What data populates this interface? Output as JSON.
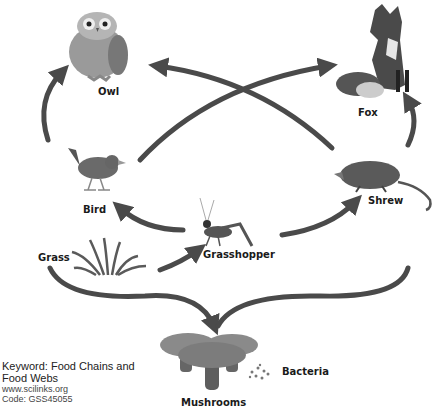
{
  "organisms": {
    "owl": "Owl",
    "fox": "Fox",
    "bird": "Bird",
    "shrew": "Shrew",
    "grass": "Grass",
    "grasshopper": "Grasshopper",
    "mushrooms": "Mushrooms",
    "bacteria": "Bacteria"
  },
  "footer": {
    "keyword_line1": "Keyword: Food Chains and",
    "keyword_line2": "Food Webs",
    "website": "www.scilinks.org",
    "code": "Code: GSS45055"
  },
  "arrows": [
    {
      "from": "Bird",
      "to": "Owl"
    },
    {
      "from": "Bird",
      "to": "Fox"
    },
    {
      "from": "Shrew",
      "to": "Owl"
    },
    {
      "from": "Shrew",
      "to": "Fox"
    },
    {
      "from": "Grasshopper",
      "to": "Bird"
    },
    {
      "from": "Grasshopper",
      "to": "Shrew"
    },
    {
      "from": "Grass",
      "to": "Grasshopper"
    },
    {
      "from": "Grass",
      "to": "Mushrooms"
    },
    {
      "from": "Shrew",
      "to": "Mushrooms"
    }
  ],
  "colors": {
    "arrow": "#4a4a4a",
    "label": "#1a1a1a"
  }
}
